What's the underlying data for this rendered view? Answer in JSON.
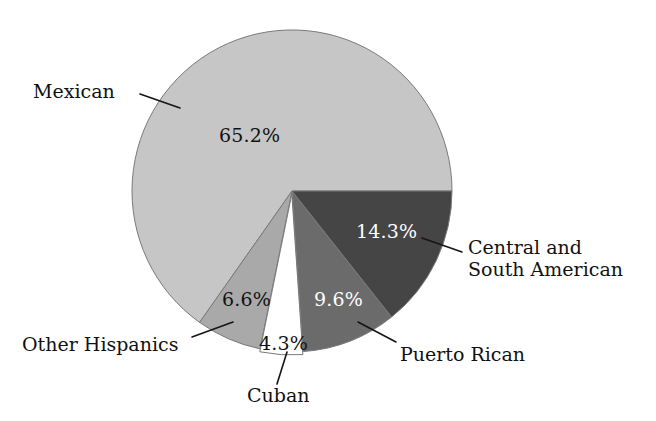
{
  "chart_data": {
    "type": "pie",
    "title": "",
    "subtitle": "",
    "xlabel": "",
    "ylabel": "",
    "legend_position": "none",
    "grid": false,
    "units": "percent",
    "categories": [
      "Mexican",
      "Central and South American",
      "Puerto Rican",
      "Cuban",
      "Other Hispanics"
    ],
    "values": [
      65.2,
      14.3,
      9.6,
      4.3,
      6.6
    ],
    "value_labels": [
      "65.2%",
      "14.3%",
      "9.6%",
      "4.3%",
      "6.6%"
    ],
    "slices": [
      {
        "name": "Mexican",
        "label": "Mexican",
        "value": 65.2,
        "value_label": "65.2%",
        "color": "#c6c6c6",
        "label_color": "#111111",
        "exploded": false
      },
      {
        "name": "Central and South American",
        "label_line1": "Central and",
        "label_line2": "South American",
        "value": 14.3,
        "value_label": "14.3%",
        "color": "#454545",
        "label_color": "#ffffff",
        "exploded": false
      },
      {
        "name": "Puerto Rican",
        "label": "Puerto Rican",
        "value": 9.6,
        "value_label": "9.6%",
        "color": "#6b6b6b",
        "label_color": "#ffffff",
        "exploded": false
      },
      {
        "name": "Cuban",
        "label": "Cuban",
        "value": 4.3,
        "value_label": "4.3%",
        "color": "#ffffff",
        "label_color": "#111111",
        "exploded": true
      },
      {
        "name": "Other Hispanics",
        "label": "Other Hispanics",
        "value": 6.6,
        "value_label": "6.6%",
        "color": "#a9a9a9",
        "label_color": "#111111",
        "exploded": false
      }
    ],
    "geometry": {
      "center_x": 292,
      "center_y": 191,
      "radius_x": 160,
      "radius_y": 161,
      "start_angle_deg": 0,
      "direction": "counterclockwise"
    },
    "colors": {
      "mexican": "#c6c6c6",
      "central_south_american": "#454545",
      "puerto_rican": "#6b6b6b",
      "cuban": "#ffffff",
      "other_hispanics": "#a9a9a9",
      "outline": "#7a7a7a",
      "text": "#111111",
      "background": "#ffffff"
    }
  }
}
